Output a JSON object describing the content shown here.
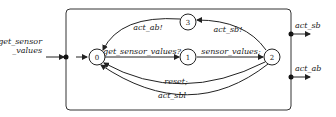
{
  "diagram": {
    "type": "timed-automaton",
    "input_port": {
      "label_line1": "get_sensor",
      "label_line2": "_values"
    },
    "output_ports": [
      {
        "label": "act_sb"
      },
      {
        "label": "act_ab"
      }
    ],
    "states": [
      {
        "id": "0",
        "initial": true
      },
      {
        "id": "1"
      },
      {
        "id": "2"
      },
      {
        "id": "3"
      }
    ],
    "transitions": [
      {
        "from": "0",
        "to": "1",
        "label": "get_sensor_values?"
      },
      {
        "from": "1",
        "to": "2",
        "label": "sensor_values;"
      },
      {
        "from": "2",
        "to": "3",
        "label": "act_sb!"
      },
      {
        "from": "3",
        "to": "0",
        "label": "act_ab!"
      },
      {
        "from": "2",
        "to": "0",
        "label": "reset;"
      },
      {
        "from": "2",
        "to": "0",
        "label": "act_sbl"
      }
    ]
  }
}
